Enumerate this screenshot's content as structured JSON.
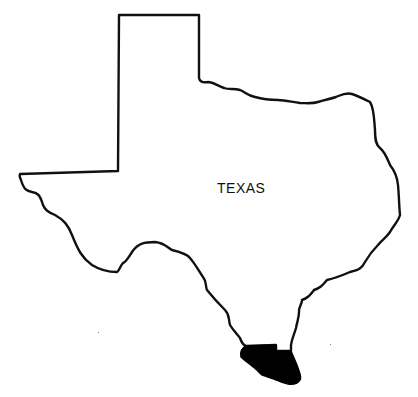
{
  "map": {
    "title": "TEXAS",
    "state_label": "TEXAS",
    "highlighted_region": {
      "description": "shaded county in far south Texas along the Rio Grande",
      "fill_color": "#000000"
    },
    "outline_color": "#111111",
    "background_color": "#ffffff"
  }
}
